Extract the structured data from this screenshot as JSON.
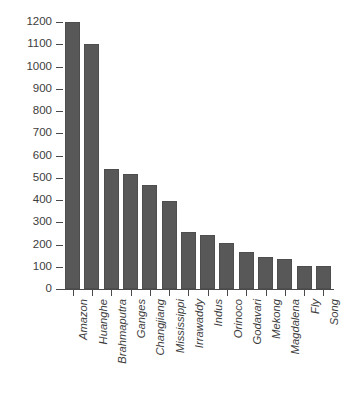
{
  "chart_data": {
    "type": "bar",
    "title": "",
    "xlabel": "",
    "ylabel": "Sediment load (Mt yr-1)",
    "ylabel_text": "Sediment load (Mt yr",
    "ylabel_sup": "-1",
    "ylabel_tail": ")",
    "ylim": [
      0,
      1200
    ],
    "ytick_step": 100,
    "yticks": [
      0,
      100,
      200,
      300,
      400,
      500,
      600,
      700,
      800,
      900,
      1000,
      1100,
      1200
    ],
    "ytick_labels": [
      "0",
      "100",
      "200",
      "300",
      "400",
      "500",
      "600",
      "700",
      "800",
      "900",
      "1000",
      "1100",
      "1200"
    ],
    "grid": false,
    "legend": false,
    "bar_color": "#585858",
    "bar_edge_color": "#4e4e4e",
    "axis_color": "#4a4a4a",
    "categories": [
      "Amazon",
      "Huanghe",
      "Brahmaputra",
      "Ganges",
      "Changjiang",
      "Mississippi",
      "Irrawaddy",
      "Indus",
      "Orinoco",
      "Godavari",
      "Mekong",
      "Magdalena",
      "Fly",
      "Song"
    ],
    "values": [
      1200,
      1100,
      538,
      518,
      467,
      397,
      255,
      243,
      205,
      165,
      143,
      133,
      104,
      102
    ]
  }
}
